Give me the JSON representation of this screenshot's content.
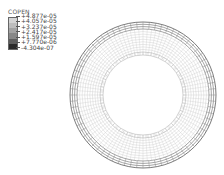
{
  "chart_data": {
    "type": "heatmap",
    "title": "",
    "variable": "COPEN",
    "legend": {
      "title": "COPEN",
      "position": "top-left",
      "values": [
        "+4.877e-05",
        "+4.057e-05",
        "+3.237e-05",
        "+2.417e-05",
        "+1.597e-05",
        "+7.770e-06",
        "-4.304e-07"
      ],
      "numeric_values": [
        4.877e-05,
        4.057e-05,
        3.237e-05,
        2.417e-05,
        1.597e-05,
        7.77e-06,
        -4.304e-07
      ],
      "band_colors": [
        "#d4d4d4",
        "#bdbdbd",
        "#a3a3a3",
        "#878787",
        "#5e5e5e",
        "#2a2a2a"
      ]
    },
    "range": [
      -4.304e-07,
      4.877e-05
    ],
    "geometry": {
      "shape": "annulus",
      "center": [
        143,
        95
      ],
      "outer_radius": 73,
      "inner_radius": 40,
      "outer_band_width": 7,
      "inner_band_width": 3
    },
    "grid": true
  },
  "colors": {
    "background": "#ffffff",
    "mesh_dark": "#6a6a6a",
    "mesh_light": "#c8c8c8",
    "outer_band": "#8c8c8c"
  }
}
